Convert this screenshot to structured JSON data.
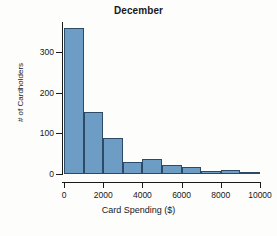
{
  "chart_data": {
    "type": "bar",
    "title": "December",
    "xlabel": "Card Spending ($)",
    "ylabel": "# of Cardholders",
    "categories": [
      "0-1000",
      "1000-2000",
      "2000-3000",
      "3000-4000",
      "4000-5000",
      "5000-6000",
      "6000-7000",
      "7000-8000",
      "8000-9000",
      "9000-10000"
    ],
    "bin_edges": [
      0,
      1000,
      2000,
      3000,
      4000,
      5000,
      6000,
      7000,
      8000,
      9000,
      10000
    ],
    "bin_width": 1000,
    "values": [
      360,
      152,
      88,
      30,
      38,
      23,
      18,
      8,
      10,
      2
    ],
    "xlim": [
      0,
      10000
    ],
    "ylim": [
      0,
      375
    ],
    "xticks": [
      0,
      2000,
      4000,
      6000,
      8000,
      10000
    ],
    "xtick_labels": [
      "0",
      "2000",
      "4000",
      "6000",
      "8000",
      "10000"
    ],
    "yticks": [
      0,
      100,
      200,
      300
    ],
    "ytick_labels": [
      "0",
      "100",
      "200",
      "300"
    ],
    "grid": false,
    "legend": false,
    "bar_color": "#6d9dc5",
    "bar_edge_color": "#2d4a66",
    "axis_color": "#1a1a1a",
    "background": "#fdfdfc"
  }
}
